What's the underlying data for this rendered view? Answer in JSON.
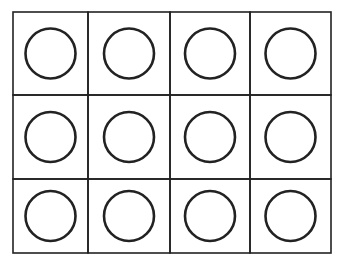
{
  "grid": {
    "rows": 3,
    "cols": 4,
    "x_lines": [
      13,
      88,
      170,
      250,
      331
    ],
    "y_lines": [
      12,
      95,
      179,
      253
    ],
    "line_color": "#222222",
    "circle_color": "#222222",
    "circle_radius": 25,
    "cells": [
      {
        "shape": "circle"
      },
      {
        "shape": "circle"
      },
      {
        "shape": "circle"
      },
      {
        "shape": "circle"
      },
      {
        "shape": "circle"
      },
      {
        "shape": "circle"
      },
      {
        "shape": "circle"
      },
      {
        "shape": "circle"
      },
      {
        "shape": "circle"
      },
      {
        "shape": "circle"
      },
      {
        "shape": "circle"
      },
      {
        "shape": "circle"
      }
    ]
  }
}
